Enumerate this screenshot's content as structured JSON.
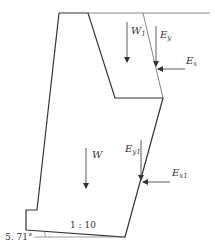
{
  "diagram": {
    "labels": {
      "W1": {
        "main": "W",
        "sub": "1"
      },
      "Ey": {
        "main": "E",
        "sub": "y"
      },
      "Ex": {
        "main": "E",
        "sub": "x"
      },
      "W": {
        "main": "W",
        "sub": ""
      },
      "Ey1": {
        "main": "E",
        "sub": "y1"
      },
      "Ex1": {
        "main": "E",
        "sub": "x1"
      }
    },
    "base_slope": "1 : 10",
    "base_angle": "5. 71°",
    "colors": {
      "line": "#333333",
      "thin_line": "#777777",
      "background": "#ffffff"
    }
  }
}
